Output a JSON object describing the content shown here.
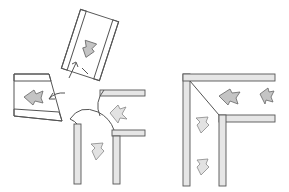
{
  "figure": {
    "panels": [
      {
        "id": "left",
        "label": "exploded corner: separate panels folding into an L-junction"
      },
      {
        "id": "right",
        "label": "assembled L-shaped corner with diagonal seam"
      }
    ],
    "colors": {
      "stroke": "#555555",
      "wall_fill": "#e6e6e6",
      "arrow_fill": "#c4c4c4",
      "background": "#ffffff"
    }
  }
}
